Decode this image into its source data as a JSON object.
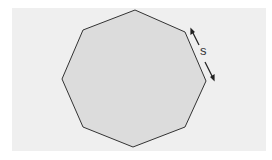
{
  "diagram": {
    "shape": "regular-octagon",
    "side_label": "s",
    "colors": {
      "background": "#efefef",
      "fill": "#dcdcdc",
      "stroke": "#333333"
    },
    "vertices": [
      [
        135,
        10
      ],
      [
        185,
        32
      ],
      [
        206,
        81
      ],
      [
        185,
        127
      ],
      [
        133,
        147
      ],
      [
        83,
        127
      ],
      [
        62,
        79
      ],
      [
        83,
        30
      ]
    ]
  }
}
